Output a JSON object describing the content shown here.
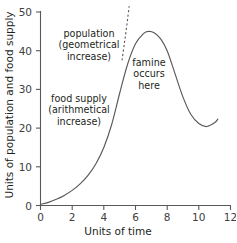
{
  "chart_data": {
    "type": "line",
    "title": "",
    "xlabel": "Units of time",
    "ylabel": "Units of population and food supply",
    "xlim": [
      0,
      12
    ],
    "ylim": [
      0,
      50
    ],
    "grid": false,
    "legend": "none",
    "xticks": [
      "0",
      "2",
      "4",
      "6",
      "8",
      "10",
      "12"
    ],
    "yticks": [
      "0",
      "10",
      "20",
      "30",
      "40",
      "50"
    ],
    "series": [
      {
        "name": "population with famine correction",
        "style": "solid",
        "color": "#58595b",
        "x": [
          0,
          0.5,
          1,
          1.5,
          2,
          2.5,
          3,
          3.5,
          4,
          4.5,
          5,
          5.5,
          6,
          6.5,
          6.8,
          7.2,
          7.6,
          8,
          8.5,
          9,
          9.5,
          10,
          10.5,
          11,
          11.2
        ],
        "y": [
          0.3,
          0.8,
          1.6,
          2.6,
          3.9,
          5.6,
          7.8,
          10.8,
          15.0,
          21.0,
          29.0,
          36.5,
          41.8,
          44.4,
          45.0,
          44.6,
          43.0,
          40.0,
          34.0,
          28.0,
          23.5,
          21.2,
          20.4,
          21.4,
          22.3
        ]
      },
      {
        "name": "population (geometrical increase) projection",
        "style": "dashed",
        "color": "#58595b",
        "x": [
          5.15,
          5.3,
          5.45,
          5.6
        ],
        "y": [
          37.5,
          42.0,
          46.5,
          51.5
        ]
      }
    ],
    "annotations": [
      {
        "name": "population-annotation",
        "lines": [
          "population",
          "(geometrical",
          "increase)"
        ],
        "x": 3.0,
        "y": 42.0
      },
      {
        "name": "food-supply-annotation",
        "lines": [
          "food supply",
          "(arithmetical",
          "increase)"
        ],
        "x": 2.5,
        "y": 24.0
      },
      {
        "name": "famine-annotation",
        "lines": [
          "famine",
          "occurs",
          "here"
        ],
        "x": 7.0,
        "y": 34.0
      }
    ]
  }
}
